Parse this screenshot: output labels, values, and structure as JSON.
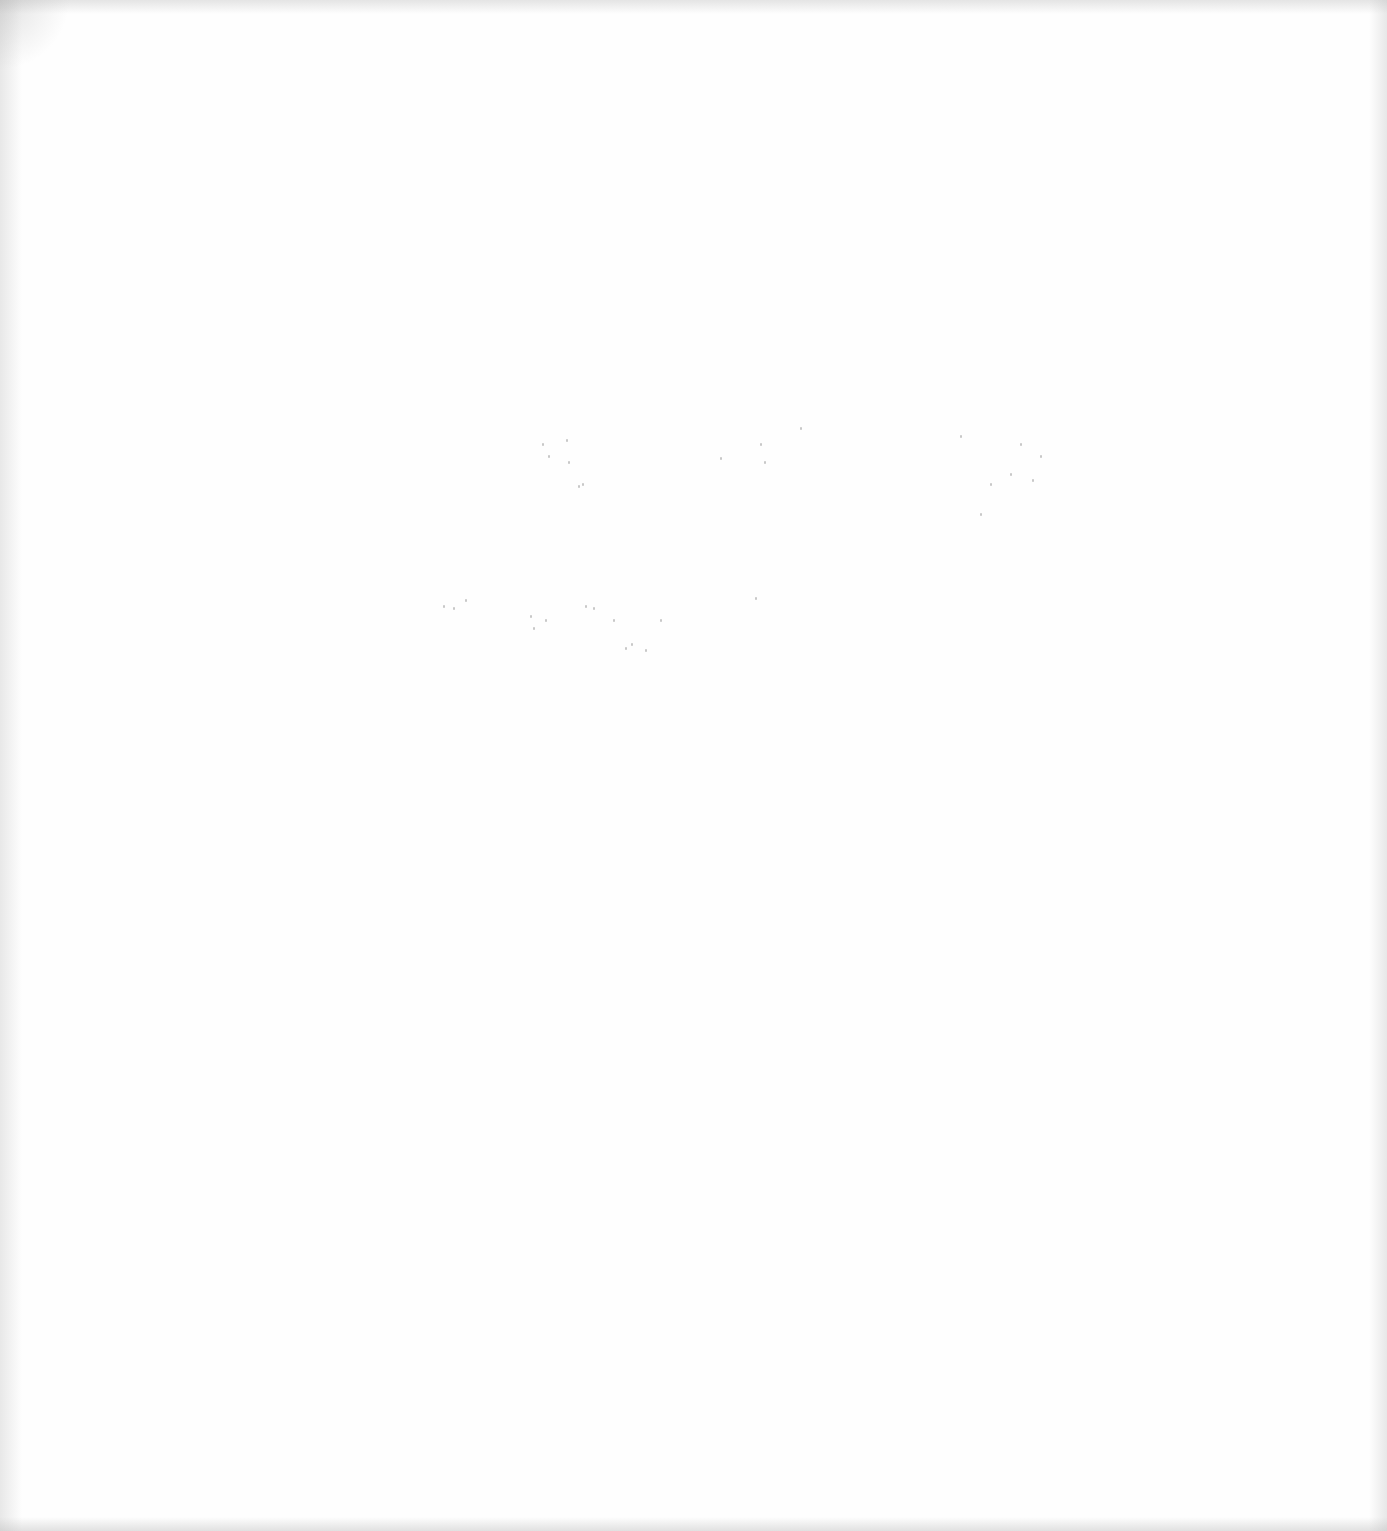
{
  "document": {
    "type": "blank-scanned-page",
    "legible_text": "",
    "background_color": "#ffffff",
    "noise_color": "#9a9a9a"
  },
  "speckle_regions": [
    {
      "name": "faint-line-1",
      "x": 520,
      "y": 425,
      "width": 550,
      "height": 80
    },
    {
      "name": "faint-line-2",
      "x": 435,
      "y": 585,
      "width": 330,
      "height": 75
    }
  ]
}
